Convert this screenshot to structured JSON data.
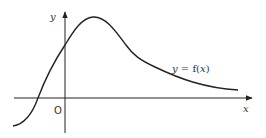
{
  "diagram": {
    "type": "function-graph",
    "axes": {
      "x_label": "x",
      "y_label": "y",
      "origin_label": "O"
    },
    "curve": {
      "label": "y = f(x)",
      "label_parts": [
        "y = f(",
        "x",
        ")"
      ],
      "description": "smooth curve rising from lower left, crossing x-axis left of origin, crossing y-axis above origin, reaching a maximum just right of the y-axis, then decaying toward the x-axis as x increases"
    },
    "colors": {
      "stroke": "#222222",
      "text": "#333333",
      "background": "#ffffff"
    }
  }
}
